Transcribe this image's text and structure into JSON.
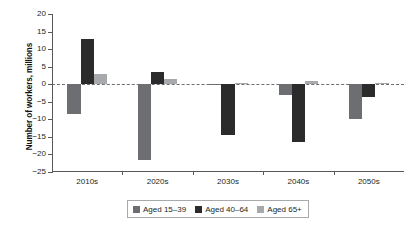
{
  "chart_data": {
    "type": "bar",
    "title": "",
    "subtitle": "",
    "xlabel": "",
    "ylabel": "Number of workers, millions",
    "categories": [
      "2010s",
      "2020s",
      "2030s",
      "2040s",
      "2050s"
    ],
    "series": [
      {
        "name": "Aged 15–39",
        "color": "#6d6e71",
        "values": [
          -8.5,
          -21.5,
          -0.3,
          -3.0,
          -10.0
        ]
      },
      {
        "name": "Aged 40–64",
        "color": "#2b2b2b",
        "values": [
          13.0,
          3.5,
          -14.5,
          -16.5,
          -3.5
        ]
      },
      {
        "name": "Aged 65+",
        "color": "#a7a9ac",
        "values": [
          3.0,
          1.5,
          0.4,
          1.0,
          0.3
        ]
      }
    ],
    "ylim": [
      -25,
      20
    ],
    "yticks": [
      20,
      15,
      10,
      5,
      0,
      -5,
      -10,
      -15,
      -20,
      -25
    ],
    "ytick_labels": [
      "20",
      "15",
      "10",
      "5",
      "0",
      "−5",
      "−10",
      "−15",
      "−20",
      "−25"
    ],
    "grid": false,
    "zero_line": true,
    "zero_line_style": "dashed",
    "legend_position": "bottom",
    "legend": [
      "Aged 15–39",
      "Aged 40–64",
      "Aged 65+"
    ]
  },
  "axis": {
    "y_title": "Number of workers, millions"
  },
  "colors": {
    "series_1": "#6d6e71",
    "series_2": "#2b2b2b",
    "series_3": "#a7a9ac",
    "axis": "#58595b",
    "text": "#231f20",
    "background": "#ffffff"
  }
}
